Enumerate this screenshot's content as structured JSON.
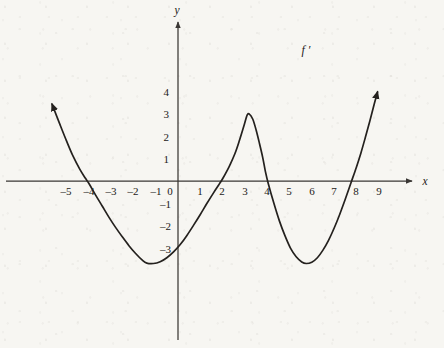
{
  "figure": {
    "background_color": "#f7f6f2",
    "ink_color": "#24211e",
    "axis_color": "#3a3734",
    "curve_label": "f ′",
    "x_axis_label": "x",
    "y_axis_label": "y"
  },
  "chart_data": {
    "type": "line",
    "title": "",
    "xlabel": "x",
    "ylabel": "y",
    "grid": false,
    "legend": "none",
    "annotations": [
      {
        "text": "f ′",
        "x": 5.7,
        "y": 5.9
      }
    ],
    "xlim": [
      -5.7,
      10.0
    ],
    "ylim": [
      -4.6,
      4.6
    ],
    "x_ticks": [
      -5,
      -4,
      -3,
      -2,
      -1,
      0,
      1,
      2,
      3,
      4,
      5,
      6,
      7,
      8,
      9
    ],
    "x_tick_labels": [
      "–5",
      "–4",
      "–3",
      "–2",
      "–1",
      "0",
      "1",
      "2",
      "3",
      "4",
      "5",
      "6",
      "7",
      "8",
      "9"
    ],
    "y_ticks": [
      -3,
      -2,
      -1,
      1,
      2,
      3,
      4
    ],
    "y_tick_labels": [
      "–3",
      "–2",
      "–1",
      "1",
      "2",
      "3",
      "4"
    ],
    "series": [
      {
        "name": "f ′",
        "x_roots": [
          -4.0,
          2.0,
          4.0,
          8.2
        ],
        "local_minima": [
          {
            "x": -1.4,
            "y": -3.7
          },
          {
            "x": 5.7,
            "y": -3.7
          }
        ],
        "local_maxima": [
          {
            "x": 3.1,
            "y": 3.0
          }
        ],
        "arrow_start": {
          "x": -5.65,
          "y": 3.45
        },
        "arrow_end": {
          "x": 8.95,
          "y": 4.0
        },
        "points": [
          [
            -5.65,
            3.45
          ],
          [
            -5.3,
            2.55
          ],
          [
            -5.0,
            1.8
          ],
          [
            -4.7,
            1.1
          ],
          [
            -4.4,
            0.52
          ],
          [
            -4.15,
            0.12
          ],
          [
            -4.0,
            -0.1
          ],
          [
            -3.7,
            -0.62
          ],
          [
            -3.4,
            -1.12
          ],
          [
            -3.1,
            -1.62
          ],
          [
            -2.8,
            -2.08
          ],
          [
            -2.5,
            -2.5
          ],
          [
            -2.2,
            -2.9
          ],
          [
            -1.9,
            -3.25
          ],
          [
            -1.6,
            -3.55
          ],
          [
            -1.4,
            -3.68
          ],
          [
            -1.1,
            -3.7
          ],
          [
            -0.8,
            -3.62
          ],
          [
            -0.5,
            -3.44
          ],
          [
            -0.2,
            -3.18
          ],
          [
            0.1,
            -2.85
          ],
          [
            0.4,
            -2.44
          ],
          [
            0.7,
            -1.98
          ],
          [
            1.0,
            -1.5
          ],
          [
            1.3,
            -1.0
          ],
          [
            1.6,
            -0.52
          ],
          [
            1.85,
            -0.14
          ],
          [
            2.0,
            0.1
          ],
          [
            2.3,
            0.66
          ],
          [
            2.55,
            1.22
          ],
          [
            2.75,
            1.8
          ],
          [
            2.95,
            2.45
          ],
          [
            3.1,
            2.95
          ],
          [
            3.2,
            3.0
          ],
          [
            3.35,
            2.78
          ],
          [
            3.5,
            2.3
          ],
          [
            3.65,
            1.7
          ],
          [
            3.8,
            1.05
          ],
          [
            3.92,
            0.42
          ],
          [
            4.05,
            -0.12
          ],
          [
            4.3,
            -1.0
          ],
          [
            4.55,
            -1.8
          ],
          [
            4.8,
            -2.46
          ],
          [
            5.05,
            -3.02
          ],
          [
            5.3,
            -3.4
          ],
          [
            5.55,
            -3.63
          ],
          [
            5.75,
            -3.7
          ],
          [
            6.0,
            -3.64
          ],
          [
            6.25,
            -3.44
          ],
          [
            6.5,
            -3.1
          ],
          [
            6.75,
            -2.66
          ],
          [
            7.0,
            -2.12
          ],
          [
            7.25,
            -1.5
          ],
          [
            7.5,
            -0.82
          ],
          [
            7.75,
            -0.1
          ],
          [
            8.0,
            0.62
          ],
          [
            8.2,
            1.25
          ],
          [
            8.4,
            1.95
          ],
          [
            8.6,
            2.68
          ],
          [
            8.8,
            3.45
          ],
          [
            8.95,
            4.0
          ]
        ]
      }
    ]
  }
}
